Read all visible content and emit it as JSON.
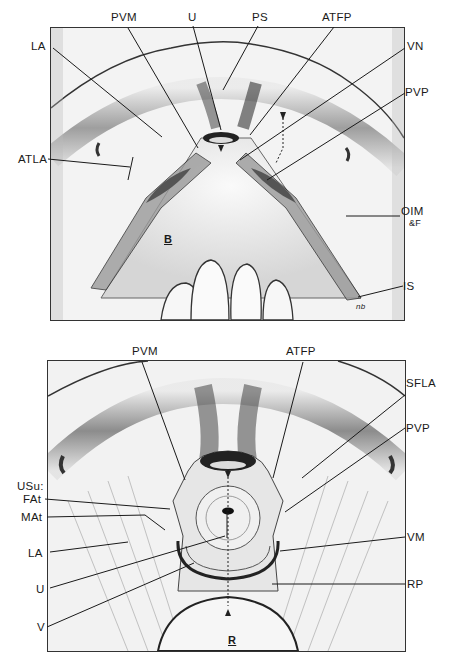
{
  "figure": {
    "top_panel": {
      "name": "bladder view",
      "center_label": "B",
      "labels": {
        "pvm": "PVM",
        "u": "U",
        "ps": "PS",
        "atfp": "ATFP",
        "la": "LA",
        "vn": "VN",
        "pvp": "PVP",
        "atla": "ATLA",
        "oim": "OIM",
        "oim_sub": "&F",
        "is": "IS",
        "signature": "nb"
      }
    },
    "bottom_panel": {
      "name": "rectum view",
      "center_label": "R",
      "labels": {
        "pvm": "PVM",
        "atfp": "ATFP",
        "sfla": "SFLA",
        "pvp": "PVP",
        "usu": "USu:",
        "fat": "FAt",
        "mat": "MAt",
        "la": "LA",
        "vm": "VM",
        "u": "U",
        "rp": "RP",
        "v": "V"
      }
    },
    "colors": {
      "ink": "#1a1a1a",
      "paper": "#ffffff",
      "tissue_light": "#f1f1f1",
      "tissue_mid": "#b8b8b8",
      "tissue_dark": "#555555"
    }
  }
}
